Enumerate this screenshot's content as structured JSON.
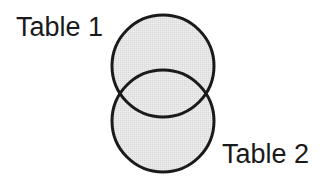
{
  "diagram": {
    "type": "venn",
    "sets": [
      {
        "label": "Table 1",
        "cx": 163,
        "cy": 66,
        "r": 51
      },
      {
        "label": "Table 2",
        "cx": 163,
        "cy": 121,
        "r": 51
      }
    ],
    "colors": {
      "fill": "#e3e3e3",
      "stroke": "#1a1a1a",
      "text": "#1a1a1a",
      "background": "#ffffff"
    }
  }
}
